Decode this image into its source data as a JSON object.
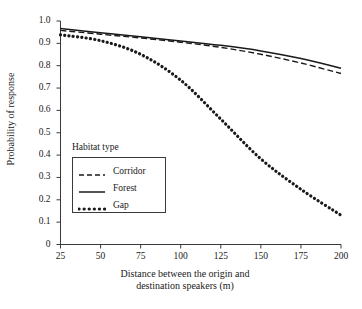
{
  "chart_data": {
    "type": "line",
    "title": "",
    "xlabel": "Distance between the origin and\ndestination speakers (m)",
    "ylabel": "Probability of response",
    "xlim": [
      25,
      200
    ],
    "ylim": [
      0,
      1.0
    ],
    "grid": false,
    "legend_position": "center-left-inside",
    "legend_title": "Habitat type",
    "xticks": [
      25,
      50,
      75,
      100,
      125,
      150,
      175,
      200
    ],
    "xtick_labels": [
      "25",
      "50",
      "75",
      "100",
      "125",
      "150",
      "175",
      "200"
    ],
    "yticks": [
      0,
      0.1,
      0.2,
      0.3,
      0.4,
      0.5,
      0.6,
      0.7,
      0.8,
      0.9,
      1.0
    ],
    "ytick_labels": [
      "0",
      "0.1",
      "0.2",
      "0.3",
      "0.4",
      "0.5",
      "0.6",
      "0.7",
      "0.8",
      "0.9",
      "1.0"
    ],
    "x": [
      25,
      50,
      75,
      100,
      125,
      150,
      175,
      200
    ],
    "series": [
      {
        "name": "Corridor",
        "style": "dashed",
        "color": "#1a1a1a",
        "values": [
          0.958,
          0.941,
          0.924,
          0.905,
          0.882,
          0.851,
          0.812,
          0.765
        ]
      },
      {
        "name": "Forest",
        "style": "solid",
        "color": "#1a1a1a",
        "values": [
          0.966,
          0.947,
          0.929,
          0.911,
          0.891,
          0.866,
          0.832,
          0.789
        ]
      },
      {
        "name": "Gap",
        "style": "dotted",
        "color": "#1a1a1a",
        "values": [
          0.938,
          0.912,
          0.851,
          0.735,
          0.561,
          0.383,
          0.247,
          0.131
        ]
      }
    ]
  },
  "legend": {
    "title": "Habitat type",
    "entries": [
      {
        "label": "Corridor",
        "style": "dashed"
      },
      {
        "label": "Forest",
        "style": "solid"
      },
      {
        "label": "Gap",
        "style": "dotted"
      }
    ]
  },
  "axes": {
    "x_title": "Distance between the origin and\ndestination speakers (m)",
    "y_title": "Probability of response"
  },
  "colors": {
    "ink": "#1a1a1a",
    "background": "#ffffff",
    "frame": "#3a3a3a"
  }
}
